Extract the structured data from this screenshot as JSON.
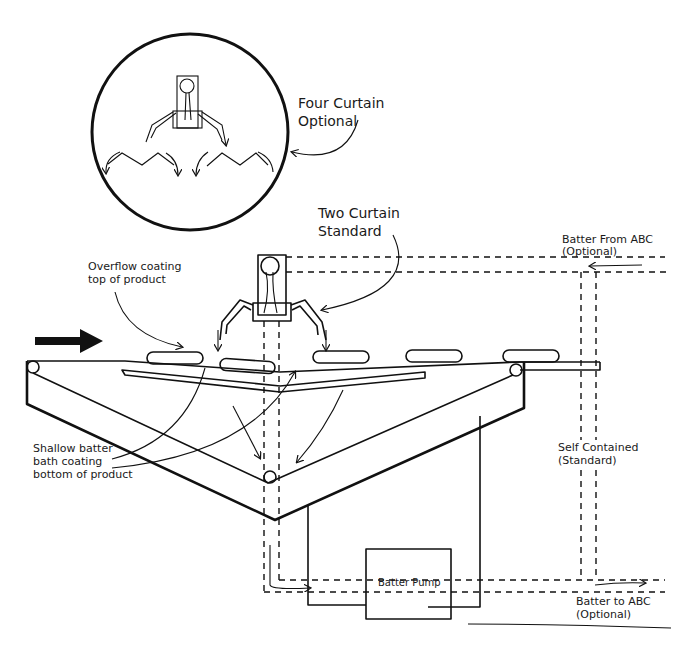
{
  "diagram": {
    "labels": {
      "four_curtain_line1": "Four Curtain",
      "four_curtain_line2": "Optional",
      "two_curtain_line1": "Two Curtain",
      "two_curtain_line2": "Standard",
      "overflow_line1": "Overflow coating",
      "overflow_line2": "top of product",
      "shallow_line1": "Shallow batter",
      "shallow_line2": "bath coating",
      "shallow_line3": "bottom of product",
      "from_abc_line1": "Batter From ABC",
      "from_abc_line2": "(Optional)",
      "self_contained_line1": "Self Contained",
      "self_contained_line2": "(Standard)",
      "to_abc_line1": "Batter to ABC",
      "to_abc_line2": "(Optional)",
      "pump": "Batter Pump"
    },
    "components": [
      "four-curtain-inset",
      "two-curtain-head",
      "conveyor",
      "batter-bath",
      "batter-pump",
      "batter-lines"
    ],
    "flow_direction": "left-to-right"
  }
}
